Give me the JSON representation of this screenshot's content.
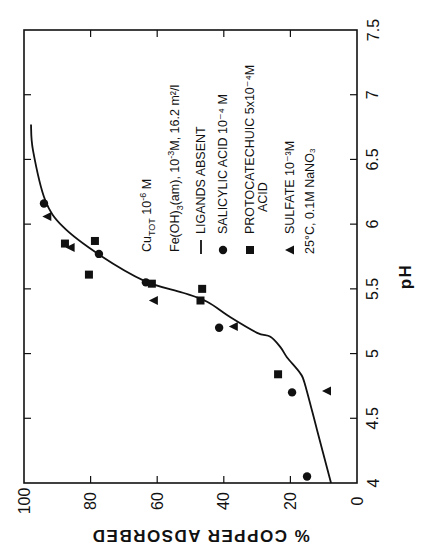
{
  "figure": {
    "orientation": "rotated 90 degrees counter-clockwise",
    "background": "#ffffff",
    "ink": "#111111"
  },
  "chart_data": {
    "type": "scatter",
    "title": "",
    "xlabel": "pH",
    "ylabel": "% COPPER ADSORBED",
    "xlim": [
      4,
      7.5
    ],
    "ylim": [
      0,
      100
    ],
    "xticks": [
      4,
      4.5,
      5,
      5.5,
      6,
      6.5,
      7,
      7.5
    ],
    "xtick_labels": [
      "4",
      "4.5",
      "5",
      "5.5",
      "6",
      "6.5",
      "7",
      "7.5"
    ],
    "yticks": [
      0,
      20,
      40,
      60,
      80,
      100
    ],
    "ytick_labels": [
      "0",
      "20",
      "40",
      "60",
      "80",
      "100"
    ],
    "grid": false,
    "legend": {
      "position": "inside, upper-left region (rotated)",
      "header_lines": [
        {
          "main": "Cu",
          "sub": "TOT",
          "rest": " 10",
          "sup": "-6",
          "tail": " M"
        },
        {
          "main": "Fe(OH)",
          "sub": "3",
          "rest": "(am), 10",
          "sup": "-3",
          "tail": "M, 16.2 m²/l"
        }
      ],
      "entries": [
        {
          "symbol": "line",
          "label": "LIGANDS  ABSENT",
          "conc": ""
        },
        {
          "symbol": "circle",
          "label": "SALICYLIC ACID",
          "conc": "10⁻⁴ M"
        },
        {
          "symbol": "square",
          "label": "PROTOCATECHUIC",
          "label2": "ACID",
          "conc": "5x10⁻⁴M"
        },
        {
          "symbol": "triangle",
          "label": "SULFATE",
          "conc": "10⁻³M"
        }
      ],
      "footer": "25°C, 0.1M NaNO₃"
    },
    "series": [
      {
        "name": "LIGANDS ABSENT",
        "type": "line",
        "points": [
          {
            "x": 4.0,
            "y": 7.8
          },
          {
            "x": 4.41,
            "y": 12.0
          },
          {
            "x": 4.76,
            "y": 15.6
          },
          {
            "x": 4.85,
            "y": 17.1
          },
          {
            "x": 4.97,
            "y": 21.0
          },
          {
            "x": 5.05,
            "y": 23.0
          },
          {
            "x": 5.13,
            "y": 26.0
          },
          {
            "x": 5.16,
            "y": 30.0
          },
          {
            "x": 5.28,
            "y": 38.0
          },
          {
            "x": 5.4,
            "y": 45.0
          },
          {
            "x": 5.47,
            "y": 52.3
          },
          {
            "x": 5.56,
            "y": 63.7
          },
          {
            "x": 5.76,
            "y": 77.2
          },
          {
            "x": 5.98,
            "y": 88.3
          },
          {
            "x": 6.19,
            "y": 93.7
          },
          {
            "x": 6.57,
            "y": 97.3
          },
          {
            "x": 6.77,
            "y": 97.9
          }
        ]
      },
      {
        "name": "SALICYLIC ACID 10⁻⁴ M",
        "marker": "circle",
        "points": [
          {
            "x": 4.05,
            "y": 15.0
          },
          {
            "x": 4.7,
            "y": 19.5
          },
          {
            "x": 5.2,
            "y": 41.4
          },
          {
            "x": 5.55,
            "y": 63.4
          },
          {
            "x": 5.77,
            "y": 77.5
          },
          {
            "x": 6.16,
            "y": 94.0
          }
        ]
      },
      {
        "name": "PROTOCATECHUIC ACID 5x10⁻⁴M",
        "marker": "square",
        "points": [
          {
            "x": 4.84,
            "y": 23.7
          },
          {
            "x": 5.41,
            "y": 47.0
          },
          {
            "x": 5.5,
            "y": 46.5
          },
          {
            "x": 5.54,
            "y": 61.6
          },
          {
            "x": 5.61,
            "y": 80.5
          },
          {
            "x": 5.85,
            "y": 87.7
          },
          {
            "x": 5.87,
            "y": 78.7
          }
        ]
      },
      {
        "name": "SULFATE 10⁻³M",
        "marker": "triangle",
        "points": [
          {
            "x": 4.71,
            "y": 9.0
          },
          {
            "x": 5.21,
            "y": 37.0
          },
          {
            "x": 5.41,
            "y": 61.0
          },
          {
            "x": 5.82,
            "y": 86.0
          },
          {
            "x": 6.06,
            "y": 93.0
          }
        ]
      }
    ]
  }
}
